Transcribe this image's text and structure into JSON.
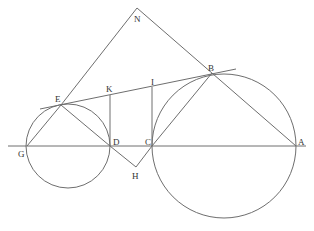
{
  "diagram": {
    "type": "geometry-figure",
    "colors": {
      "stroke": "#6e6e6e",
      "label": "#333333",
      "background": "#ffffff"
    },
    "points": {
      "A": {
        "label": "A",
        "x": 296,
        "y": 146
      },
      "B": {
        "label": "B",
        "x": 212,
        "y": 73
      },
      "C": {
        "label": "C",
        "x": 152,
        "y": 146
      },
      "D": {
        "label": "D",
        "x": 110,
        "y": 146
      },
      "E": {
        "label": "E",
        "x": 61,
        "y": 105
      },
      "G": {
        "label": "G",
        "x": 27,
        "y": 146
      },
      "H": {
        "label": "H",
        "x": 136,
        "y": 167
      },
      "I": {
        "label": "I",
        "x": 152,
        "y": 87
      },
      "K": {
        "label": "K",
        "x": 110,
        "y": 95
      },
      "N": {
        "label": "N",
        "x": 137,
        "y": 8
      }
    },
    "circles": [
      {
        "name": "small-circle",
        "cx": 68,
        "cy": 146,
        "r": 42
      },
      {
        "name": "large-circle",
        "cx": 224,
        "cy": 146,
        "r": 72
      }
    ],
    "segments": [
      "G-A (baseline)",
      "E-B (tangent)",
      "N-E",
      "N-A",
      "G-E",
      "E-D",
      "C-B",
      "D-H",
      "H-C",
      "K-D",
      "I-C"
    ]
  }
}
